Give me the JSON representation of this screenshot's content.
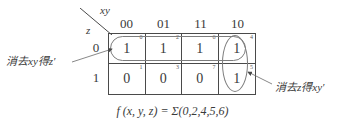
{
  "axes": {
    "col_var_label": "xy",
    "row_var_label": "z",
    "col_headers": [
      "00",
      "01",
      "11",
      "10"
    ],
    "row_headers": [
      "0",
      "1"
    ]
  },
  "kmap": {
    "rows": [
      {
        "row_label": "0",
        "cells": [
          {
            "index": "0",
            "value": "1"
          },
          {
            "index": "2",
            "value": "1"
          },
          {
            "index": "6",
            "value": "1"
          },
          {
            "index": "4",
            "value": "1"
          }
        ]
      },
      {
        "row_label": "1",
        "cells": [
          {
            "index": "1",
            "value": "0"
          },
          {
            "index": "3",
            "value": "0"
          },
          {
            "index": "7",
            "value": "0"
          },
          {
            "index": "5",
            "value": "1"
          }
        ]
      }
    ]
  },
  "groups": [
    {
      "name": "row-group",
      "annotation": "消去xy得z′"
    },
    {
      "name": "column-group",
      "annotation": "消去z得xy′"
    }
  ],
  "annotations": {
    "left": "消去xy得z′",
    "right": "消去z得xy′"
  },
  "formula": "f (x, y, z) = Σ(0,2,4,5,6)",
  "colors": {
    "grid_line": "#4a4a4a",
    "oval": "#7d7d7d",
    "text": "#3a3a3a",
    "background": "#ffffff"
  }
}
